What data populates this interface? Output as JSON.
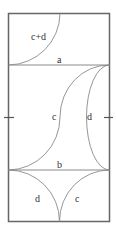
{
  "diagram": {
    "labels": {
      "top_arc": "c+d",
      "line_a": "a",
      "mid_c": "c",
      "mid_d": "d",
      "line_b": "b",
      "bottom_d": "d",
      "bottom_c": "c"
    },
    "colors": {
      "frame": "#666666",
      "curve": "#8a8a8a",
      "text": "#333333"
    }
  }
}
